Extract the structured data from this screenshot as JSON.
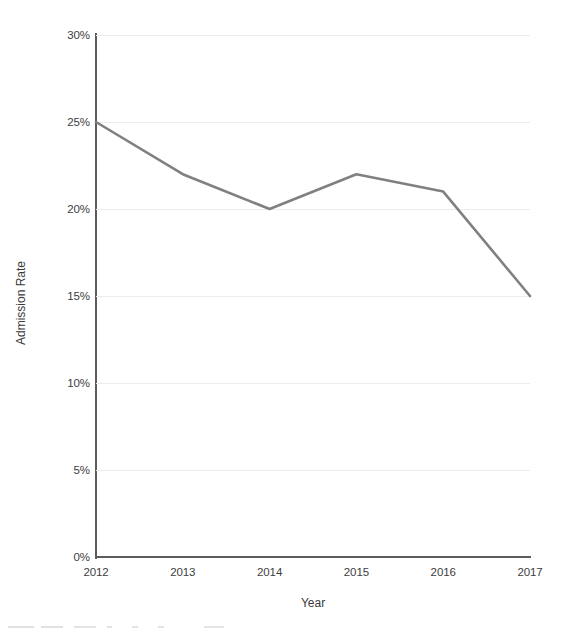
{
  "chart_data": {
    "type": "line",
    "title": "",
    "xlabel": "Year",
    "ylabel": "Admission Rate",
    "categories": [
      "2012",
      "2013",
      "2014",
      "2015",
      "2016",
      "2017"
    ],
    "values": [
      25,
      22,
      20,
      22,
      21,
      15
    ],
    "series": [
      {
        "name": "Admission Rate",
        "values": [
          25,
          22,
          20,
          22,
          21,
          15
        ]
      }
    ],
    "ylim": [
      0,
      30
    ],
    "ytick_labels": [
      "0%",
      "5%",
      "10%",
      "15%",
      "20%",
      "25%",
      "30%"
    ],
    "ytick_values": [
      0,
      5,
      10,
      15,
      20,
      25,
      30
    ],
    "xtick_labels": [
      "2012",
      "2013",
      "2014",
      "2015",
      "2016",
      "2017"
    ],
    "grid": true,
    "legend": false,
    "legend_position": "none",
    "line_color": "#808080",
    "grid_color": "#ececec",
    "axis_color": "#5c5c5c",
    "text_color": "#3a3a3a",
    "markers": false,
    "annotations": []
  }
}
